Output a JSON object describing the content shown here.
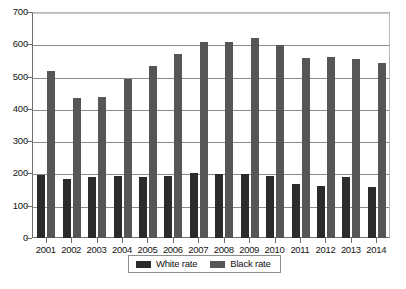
{
  "chart_data": {
    "type": "bar",
    "title": "",
    "xlabel": "",
    "ylabel": "",
    "ylim": [
      0,
      700
    ],
    "ytick_step": 100,
    "yticks": [
      0,
      100,
      200,
      300,
      400,
      500,
      600,
      700
    ],
    "grid": true,
    "legend_position": "bottom-center",
    "categories": [
      "2001",
      "2002",
      "2003",
      "2004",
      "2005",
      "2006",
      "2007",
      "2008",
      "2009",
      "2010",
      "2011",
      "2012",
      "2013",
      "2014"
    ],
    "series": [
      {
        "name": "White rate",
        "color": "#2b2b2b",
        "values": [
          195,
          183,
          188,
          191,
          189,
          193,
          201,
          199,
          197,
          192,
          168,
          162,
          190,
          157
        ]
      },
      {
        "name": "Black rate",
        "color": "#565656",
        "values": [
          517,
          433,
          437,
          492,
          534,
          571,
          608,
          608,
          618,
          598,
          558,
          560,
          555,
          543
        ]
      }
    ]
  },
  "legend": {
    "entries": [
      {
        "label": "White rate",
        "swatch": "white-rate"
      },
      {
        "label": "Black rate",
        "swatch": "black-rate"
      }
    ]
  },
  "caption": {
    "text": ""
  }
}
